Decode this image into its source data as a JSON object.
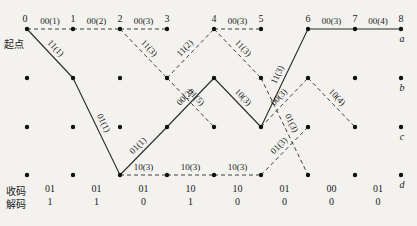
{
  "diagram": {
    "type": "trellis",
    "start_label": "起点",
    "time_labels": [
      "0",
      "1",
      "2",
      "3",
      "4",
      "5",
      "6",
      "7",
      "8"
    ],
    "state_labels": [
      "a",
      "b",
      "c",
      "d"
    ],
    "col_x": [
      27,
      73,
      120,
      167,
      214,
      261,
      308,
      355,
      401
    ],
    "row_y": [
      29,
      78,
      127,
      175
    ],
    "edges": [
      {
        "from": [
          0,
          0
        ],
        "to": [
          1,
          0
        ],
        "label": "00(1)",
        "style": "dashed"
      },
      {
        "from": [
          1,
          0
        ],
        "to": [
          2,
          0
        ],
        "label": "00(2)",
        "style": "dashed"
      },
      {
        "from": [
          2,
          0
        ],
        "to": [
          3,
          0
        ],
        "label": "00(3)",
        "style": "dashed"
      },
      {
        "from": [
          4,
          0
        ],
        "to": [
          5,
          0
        ],
        "label": "00(3)",
        "style": "dashed"
      },
      {
        "from": [
          6,
          0
        ],
        "to": [
          7,
          0
        ],
        "label": "00(3)",
        "style": "solid"
      },
      {
        "from": [
          7,
          0
        ],
        "to": [
          8,
          0
        ],
        "label": "00(4)",
        "style": "solid"
      },
      {
        "from": [
          0,
          0
        ],
        "to": [
          1,
          1
        ],
        "label": "11(1)",
        "style": "solid"
      },
      {
        "from": [
          1,
          1
        ],
        "to": [
          2,
          3
        ],
        "label": "01(1)",
        "style": "solid"
      },
      {
        "from": [
          2,
          3
        ],
        "to": [
          3,
          2
        ],
        "label": "01(1)",
        "style": "solid"
      },
      {
        "from": [
          3,
          2
        ],
        "to": [
          4,
          1
        ],
        "label": "00(2)",
        "style": "solid"
      },
      {
        "from": [
          4,
          1
        ],
        "to": [
          5,
          2
        ],
        "label": "10(3)",
        "style": "solid"
      },
      {
        "from": [
          5,
          2
        ],
        "to": [
          6,
          0
        ],
        "label": "11(3)",
        "style": "solid"
      },
      {
        "from": [
          2,
          0
        ],
        "to": [
          3,
          1
        ],
        "label": "11(3)",
        "style": "dashed"
      },
      {
        "from": [
          3,
          1
        ],
        "to": [
          4,
          0
        ],
        "label": "11(2)",
        "style": "dashed"
      },
      {
        "from": [
          4,
          0
        ],
        "to": [
          5,
          1
        ],
        "label": "11(3)",
        "style": "dashed"
      },
      {
        "from": [
          3,
          1
        ],
        "to": [
          4,
          2
        ],
        "label": "01(5)",
        "style": "dashed"
      },
      {
        "from": [
          2,
          3
        ],
        "to": [
          3,
          3
        ],
        "label": "10(3)",
        "style": "dashed"
      },
      {
        "from": [
          3,
          3
        ],
        "to": [
          4,
          3
        ],
        "label": "10(3)",
        "style": "dashed"
      },
      {
        "from": [
          4,
          3
        ],
        "to": [
          5,
          3
        ],
        "label": "10(3)",
        "style": "dashed"
      },
      {
        "from": [
          5,
          3
        ],
        "to": [
          6,
          2
        ],
        "label": "01(3)",
        "style": "dashed"
      },
      {
        "from": [
          5,
          1
        ],
        "to": [
          6,
          3
        ],
        "label": "01(3)",
        "style": "dashed"
      },
      {
        "from": [
          5,
          2
        ],
        "to": [
          6,
          1
        ],
        "label": "00(3)",
        "style": "dashed"
      },
      {
        "from": [
          6,
          1
        ],
        "to": [
          7,
          2
        ],
        "label": "10(4)",
        "style": "dashed"
      }
    ]
  },
  "table": {
    "received_label": "收码",
    "decoded_label": "解码",
    "received": [
      "01",
      "01",
      "01",
      "10",
      "10",
      "01",
      "00",
      "01"
    ],
    "decoded": [
      "1",
      "1",
      "0",
      "1",
      "0",
      "0",
      "0",
      "0"
    ]
  }
}
